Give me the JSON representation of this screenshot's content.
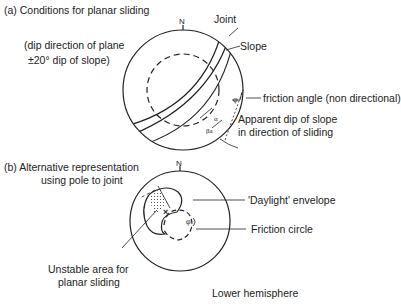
{
  "part_a": {
    "title": "(a) Conditions for planar sliding",
    "condition_line1": "(dip direction of plane",
    "condition_line2": "±20° dip of slope)",
    "north": "N",
    "labels": {
      "joint": "Joint",
      "slope": "Slope",
      "friction": "friction angle (non directional)",
      "apparent_line1": "Apparent dip of slope",
      "apparent_line2": "in direction of sliding",
      "phi": "φ",
      "alpha": "α",
      "beta": "βa"
    }
  },
  "part_b": {
    "title_line1": "(b) Alternative representation",
    "title_line2": "using pole to joint",
    "north": "N",
    "labels": {
      "daylight": "'Daylight' envelope",
      "friction_circle": "Friction circle",
      "unstable_line1": "Unstable area for",
      "unstable_line2": "planar sliding",
      "phi": "φ",
      "pole_marker": "×"
    },
    "footer": "Lower hemisphere"
  }
}
